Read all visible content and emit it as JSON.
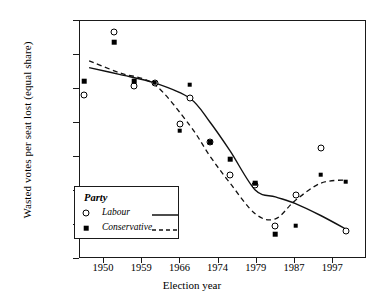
{
  "chart_data": {
    "type": "scatter",
    "title": "",
    "xlabel": "Election year",
    "ylabel": "Wasted votes per seat lost (equal share)",
    "categories": [
      "1950",
      "1959",
      "1966",
      "1974",
      "1979",
      "1987",
      "1997"
    ],
    "x_tick_labels": [
      "1950",
      "1959",
      "1966",
      "1974",
      "1979",
      "1987",
      "1997"
    ],
    "y_tick_labels": [
      "11 000",
      "12 000",
      "13 000",
      "14 000",
      "15 000",
      "16 000",
      "17 000",
      "18 000"
    ],
    "y_ticks": [
      11000,
      12000,
      13000,
      14000,
      15000,
      16000,
      17000,
      18000
    ],
    "ylim": [
      11000,
      18000
    ],
    "xlim": [
      1944,
      2001
    ],
    "grid": false,
    "legend": {
      "title": "Party",
      "position": "inside-lower-left",
      "entries": [
        {
          "name": "Labour",
          "marker": "open-circle",
          "line": "solid"
        },
        {
          "name": "Conservative",
          "marker": "filled-square",
          "line": "dashed"
        }
      ]
    },
    "series": [
      {
        "name": "Labour",
        "marker": "open-circle",
        "line": "solid",
        "points": [
          {
            "x": 1945,
            "y": 15800
          },
          {
            "x": 1951,
            "y": 17650
          },
          {
            "x": 1955,
            "y": 16050
          },
          {
            "x": 1959,
            "y": 16150
          },
          {
            "x": 1964,
            "y": 14950
          },
          {
            "x": 1966,
            "y": 15700
          },
          {
            "x": 1970,
            "y": 14400
          },
          {
            "x": 1974,
            "y": 13450
          },
          {
            "x": 1979,
            "y": 13150
          },
          {
            "x": 1983,
            "y": 11950
          },
          {
            "x": 1987,
            "y": 12850
          },
          {
            "x": 1992,
            "y": 14250
          },
          {
            "x": 1997,
            "y": 11800
          }
        ],
        "trend": [
          [
            1946,
            16600
          ],
          [
            1952,
            16400
          ],
          [
            1959,
            16150
          ],
          [
            1966,
            15700
          ],
          [
            1970,
            15000
          ],
          [
            1974,
            14150
          ],
          [
            1979,
            13000
          ],
          [
            1983,
            12800
          ],
          [
            1987,
            12600
          ],
          [
            1992,
            12250
          ],
          [
            1997,
            11850
          ]
        ]
      },
      {
        "name": "Conservative",
        "marker": "filled-square",
        "line": "dashed",
        "points": [
          {
            "x": 1945,
            "y": 16200
          },
          {
            "x": 1951,
            "y": 17350
          },
          {
            "x": 1955,
            "y": 16200
          },
          {
            "x": 1959,
            "y": 16150
          },
          {
            "x": 1964,
            "y": 14750
          },
          {
            "x": 1966,
            "y": 16100
          },
          {
            "x": 1970,
            "y": 14400
          },
          {
            "x": 1974,
            "y": 13900
          },
          {
            "x": 1979,
            "y": 13200
          },
          {
            "x": 1983,
            "y": 11700
          },
          {
            "x": 1987,
            "y": 11950
          },
          {
            "x": 1992,
            "y": 13450
          },
          {
            "x": 1997,
            "y": 13250
          }
        ],
        "trend": [
          [
            1946,
            16800
          ],
          [
            1952,
            16450
          ],
          [
            1959,
            16100
          ],
          [
            1966,
            14900
          ],
          [
            1970,
            14000
          ],
          [
            1974,
            13200
          ],
          [
            1979,
            12300
          ],
          [
            1983,
            12150
          ],
          [
            1987,
            12700
          ],
          [
            1992,
            13200
          ],
          [
            1997,
            13300
          ]
        ]
      }
    ]
  }
}
